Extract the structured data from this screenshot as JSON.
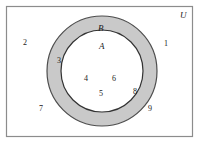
{
  "diagram": {
    "type": "venn-set-diagram",
    "title_label": "U",
    "universe": {
      "name": "U",
      "label": "U",
      "shape": "rectangle",
      "fill_color": "#ffffff",
      "stroke_color": "#808080"
    },
    "sets": [
      {
        "key": "B",
        "label": "B",
        "shape": "circle",
        "fill_color": "#c8c8c8",
        "stroke_color": "#555555",
        "description": "outer-circle-shaded-annulus"
      },
      {
        "key": "A",
        "label": "A",
        "shape": "circle",
        "fill_color": "#ffffff",
        "stroke_color": "#333333",
        "description": "inner-circle"
      }
    ],
    "elements": [
      {
        "value": "1",
        "region": "outside-both",
        "x": 164,
        "y": 40
      },
      {
        "value": "2",
        "region": "outside-both",
        "x": 23,
        "y": 39
      },
      {
        "value": "3",
        "region": "in-B-not-A",
        "x": 57,
        "y": 57
      },
      {
        "value": "4",
        "region": "in-A",
        "x": 84,
        "y": 75
      },
      {
        "value": "5",
        "region": "in-A",
        "x": 99,
        "y": 90
      },
      {
        "value": "6",
        "region": "in-A",
        "x": 112,
        "y": 75
      },
      {
        "value": "7",
        "region": "outside-both",
        "x": 39,
        "y": 105
      },
      {
        "value": "8",
        "region": "in-B-not-A",
        "x": 133,
        "y": 88
      },
      {
        "value": "9",
        "region": "outside-both",
        "x": 148,
        "y": 105
      }
    ],
    "set_label_positions": [
      {
        "key": "B",
        "x": 98,
        "y": 24
      },
      {
        "key": "A",
        "x": 99,
        "y": 42
      }
    ],
    "universe_label_position": {
      "x": 180,
      "y": 11
    }
  }
}
